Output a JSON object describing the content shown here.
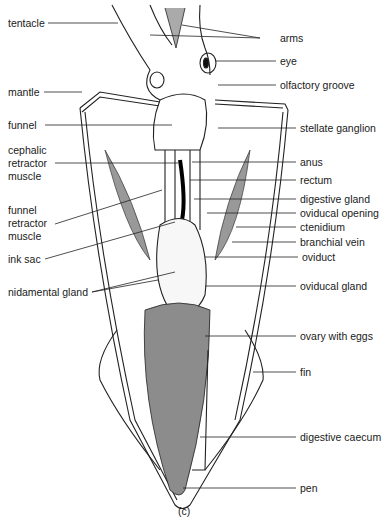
{
  "caption": "(c)",
  "labels_left": [
    {
      "id": "tentacle",
      "text": "tentacle",
      "x": 8,
      "y": 17,
      "lx1": 48,
      "ly": 23,
      "lx2": 118,
      "ly2": 23
    },
    {
      "id": "mantle",
      "text": "mantle",
      "x": 8,
      "y": 86,
      "lx1": 44,
      "ly": 92,
      "lx2": 82,
      "ly2": 92
    },
    {
      "id": "funnel",
      "text": "funnel",
      "x": 8,
      "y": 119,
      "lx1": 45,
      "ly": 125,
      "lx2": 172,
      "ly2": 125
    },
    {
      "id": "cephalic-retractor-muscle",
      "text": "cephalic\nretractor\nmuscle",
      "x": 8,
      "y": 144,
      "lx1": 55,
      "ly": 163,
      "lx2": 178,
      "ly2": 163
    },
    {
      "id": "funnel-retractor-muscle",
      "text": "funnel\nretractor\nmuscle",
      "x": 8,
      "y": 204,
      "lx1": 55,
      "ly": 224,
      "lx2": 162,
      "ly2": 190
    },
    {
      "id": "ink-sac",
      "text": "ink sac",
      "x": 8,
      "y": 253,
      "lx1": 45,
      "ly": 259,
      "lx2": 175,
      "ly2": 222
    },
    {
      "id": "nidamental-gland",
      "text": "nidamental gland",
      "x": 8,
      "y": 286,
      "lx1": 92,
      "ly": 292,
      "lx2": 158,
      "ly2": 280
    }
  ],
  "labels_right": [
    {
      "id": "arms",
      "text": "arms",
      "x": 280,
      "y": 32,
      "ly": 38,
      "lx1": 182,
      "ly1": 25
    },
    {
      "id": "eye",
      "text": "eye",
      "x": 280,
      "y": 55,
      "ly": 61,
      "lx1": 216,
      "ly1": 61
    },
    {
      "id": "olfactory-groove",
      "text": "olfactory groove",
      "x": 280,
      "y": 79,
      "ly": 85,
      "lx1": 218,
      "ly1": 85
    },
    {
      "id": "stellate-ganglion",
      "text": "stellate ganglion",
      "x": 300,
      "y": 122,
      "ly": 128,
      "lx1": 218,
      "ly1": 128
    },
    {
      "id": "anus",
      "text": "anus",
      "x": 300,
      "y": 156,
      "ly": 162,
      "lx1": 192,
      "ly1": 162
    },
    {
      "id": "rectum",
      "text": "rectum",
      "x": 300,
      "y": 174,
      "ly": 180,
      "lx1": 190,
      "ly1": 180
    },
    {
      "id": "digestive-gland",
      "text": "digestive gland",
      "x": 300,
      "y": 193,
      "ly": 199,
      "lx1": 194,
      "ly1": 199
    },
    {
      "id": "oviducal-opening",
      "text": "oviducal opening",
      "x": 300,
      "y": 207,
      "ly": 213,
      "lx1": 207,
      "ly1": 213
    },
    {
      "id": "ctenidium",
      "text": "ctenidium",
      "x": 300,
      "y": 221,
      "ly": 227,
      "lx1": 236,
      "ly1": 227
    },
    {
      "id": "branchial-vein",
      "text": "branchial vein",
      "x": 300,
      "y": 236,
      "ly": 242,
      "lx1": 232,
      "ly1": 242
    },
    {
      "id": "oviduct",
      "text": "oviduct",
      "x": 302,
      "y": 251,
      "ly": 257,
      "lx1": 205,
      "ly1": 257
    },
    {
      "id": "oviducal-gland",
      "text": "oviducal gland",
      "x": 300,
      "y": 280,
      "ly": 286,
      "lx1": 205,
      "ly1": 286
    },
    {
      "id": "ovary-with-eggs",
      "text": "ovary with eggs",
      "x": 300,
      "y": 330,
      "ly": 336,
      "lx1": 205,
      "ly1": 336
    },
    {
      "id": "fin",
      "text": "fin",
      "x": 300,
      "y": 366,
      "ly": 372,
      "lx1": 253,
      "ly1": 372
    },
    {
      "id": "digestive-caecum",
      "text": "digestive caecum",
      "x": 300,
      "y": 431,
      "ly": 437,
      "lx1": 200,
      "ly1": 437
    },
    {
      "id": "pen",
      "text": "pen",
      "x": 300,
      "y": 482,
      "ly": 488,
      "lx1": 183,
      "ly1": 488
    }
  ]
}
